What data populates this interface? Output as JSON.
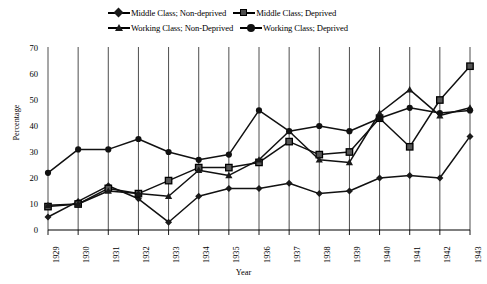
{
  "chart_data": {
    "type": "line",
    "title": "",
    "xlabel": "Year",
    "ylabel": "Percentage",
    "ylim": [
      0,
      70
    ],
    "yticks": [
      0,
      10,
      20,
      30,
      40,
      50,
      60,
      70
    ],
    "grid": "vertical",
    "legend_position": "top-center",
    "categories": [
      "1929",
      "1930",
      "1931",
      "1932",
      "1933",
      "1934",
      "1935",
      "1936",
      "1937",
      "1938",
      "1939",
      "1940",
      "1941",
      "1942",
      "1943"
    ],
    "series": [
      {
        "name": "Middle Class; Non-deprived",
        "marker": "diamond",
        "values": [
          5,
          11,
          17,
          12,
          3,
          13,
          16,
          16,
          18,
          14,
          15,
          20,
          21,
          20,
          36
        ]
      },
      {
        "name": "Middle Class; Deprived",
        "marker": "square",
        "values": [
          9,
          10,
          16,
          14,
          19,
          24,
          24,
          26,
          34,
          29,
          30,
          43,
          32,
          50,
          63
        ]
      },
      {
        "name": "Working Class; Non-Deprived",
        "marker": "triangle",
        "values": [
          9.5,
          10,
          15,
          14,
          13,
          23,
          21,
          27,
          38,
          27,
          26,
          45,
          54,
          44,
          47
        ]
      },
      {
        "name": "Working Class; Deprived",
        "marker": "circle",
        "values": [
          22,
          31,
          31,
          35,
          30,
          27,
          29,
          46,
          38,
          40,
          38,
          43,
          47,
          45,
          46
        ]
      }
    ]
  }
}
